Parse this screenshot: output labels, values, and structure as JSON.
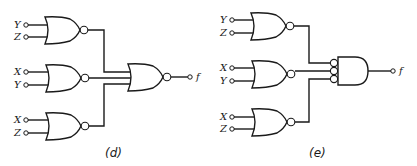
{
  "diagrams": [
    {
      "id": "d",
      "caption": "(d)",
      "gates": [
        {
          "type": "NOR",
          "inputs": [
            "Y",
            "Z"
          ]
        },
        {
          "type": "NOR",
          "inputs": [
            "X",
            "Y"
          ]
        },
        {
          "type": "NOR",
          "inputs": [
            "X",
            "Z"
          ]
        }
      ],
      "output_gate": {
        "type": "NOR",
        "inputs": 3
      },
      "output_label": "f"
    },
    {
      "id": "e",
      "caption": "(e)",
      "gates": [
        {
          "type": "NOR",
          "inputs": [
            "Y",
            "Z"
          ]
        },
        {
          "type": "NOR",
          "inputs": [
            "X",
            "Y"
          ]
        },
        {
          "type": "NOR",
          "inputs": [
            "X",
            "Z"
          ]
        }
      ],
      "output_gate": {
        "type": "AND with inverted inputs",
        "inputs": 3
      },
      "output_label": "f"
    }
  ]
}
